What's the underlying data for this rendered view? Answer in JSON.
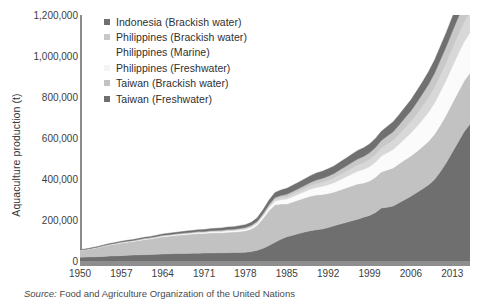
{
  "chart_data": {
    "type": "area",
    "title": "",
    "xlabel": "",
    "ylabel": "Aquaculture production (t)",
    "ylim": [
      0,
      1200000
    ],
    "xlim": [
      1950,
      2016
    ],
    "grid": false,
    "stacked": true,
    "legend_position": "top-left",
    "ytick_labels": [
      "1,200,000",
      "1,000,000",
      "800,000",
      "600,000",
      "400,000",
      "200,000",
      "0"
    ],
    "ytick_values": [
      1200000,
      1000000,
      800000,
      600000,
      400000,
      200000,
      0
    ],
    "xtick_labels": [
      "1950",
      "1957",
      "1964",
      "1971",
      "1978",
      "1985",
      "1992",
      "1999",
      "2006",
      "2013"
    ],
    "xtick_values": [
      1950,
      1957,
      1964,
      1971,
      1978,
      1985,
      1992,
      1999,
      2006,
      2013
    ],
    "x": [
      1950,
      1951,
      1952,
      1953,
      1954,
      1955,
      1956,
      1957,
      1958,
      1959,
      1960,
      1961,
      1962,
      1963,
      1964,
      1965,
      1966,
      1967,
      1968,
      1969,
      1970,
      1971,
      1972,
      1973,
      1974,
      1975,
      1976,
      1977,
      1978,
      1979,
      1980,
      1981,
      1982,
      1983,
      1984,
      1985,
      1986,
      1987,
      1988,
      1989,
      1990,
      1991,
      1992,
      1993,
      1994,
      1995,
      1996,
      1997,
      1998,
      1999,
      2000,
      2001,
      2002,
      2003,
      2004,
      2005,
      2006,
      2007,
      2008,
      2009,
      2010,
      2011,
      2012,
      2013,
      2014,
      2015,
      2016
    ],
    "series": [
      {
        "name": "Taiwan (Freshwater)",
        "color": "#6f6f6f",
        "stack_order": 1,
        "values": [
          18000,
          19000,
          20000,
          21000,
          22000,
          24000,
          25000,
          26000,
          28000,
          29000,
          30000,
          31000,
          32000,
          33000,
          34000,
          35000,
          36000,
          36500,
          37000,
          37500,
          38000,
          38500,
          39000,
          39500,
          40000,
          40500,
          41000,
          42000,
          43000,
          46000,
          52000,
          62000,
          76000,
          92000,
          106000,
          118000,
          126000,
          134000,
          141000,
          148000,
          152000,
          156000,
          163000,
          172000,
          180000,
          188000,
          196000,
          204000,
          214000,
          222000,
          236000,
          258000,
          262000,
          268000,
          284000,
          300000,
          316000,
          334000,
          352000,
          372000,
          398000,
          436000,
          480000,
          530000,
          580000,
          630000,
          668000
        ]
      },
      {
        "name": "Taiwan (Brackish water)",
        "color": "#c2c2c2",
        "stack_order": 2,
        "values": [
          34000,
          36000,
          40000,
          44000,
          50000,
          54000,
          58000,
          62000,
          64000,
          66000,
          70000,
          74000,
          76000,
          80000,
          84000,
          86000,
          88000,
          90000,
          92000,
          94000,
          96000,
          96000,
          98000,
          98000,
          98000,
          100000,
          100000,
          102000,
          104000,
          110000,
          122000,
          146000,
          170000,
          182000,
          172000,
          160000,
          162000,
          164000,
          166000,
          168000,
          170000,
          168000,
          166000,
          164000,
          166000,
          168000,
          170000,
          172000,
          166000,
          168000,
          172000,
          176000,
          182000,
          186000,
          190000,
          194000,
          196000,
          200000,
          206000,
          212000,
          220000,
          228000,
          234000,
          240000,
          244000,
          248000,
          250000
        ]
      },
      {
        "name": "Philippines (Freshwater)",
        "color": "#fbfbfb",
        "stack_order": 3,
        "values": [
          1000,
          1000,
          1200,
          1400,
          1600,
          1800,
          2000,
          2200,
          2400,
          2600,
          2800,
          3000,
          3200,
          3400,
          3600,
          3800,
          4000,
          4200,
          4400,
          4600,
          4800,
          5000,
          5400,
          5800,
          6200,
          6600,
          7000,
          7600,
          8200,
          9000,
          10000,
          12000,
          15000,
          18000,
          21000,
          24000,
          26000,
          28000,
          31000,
          34000,
          37000,
          40000,
          43000,
          46000,
          50000,
          54000,
          58000,
          62000,
          66000,
          70000,
          74000,
          78000,
          84000,
          90000,
          96000,
          104000,
          112000,
          122000,
          132000,
          142000,
          152000,
          162000,
          170000,
          178000,
          186000,
          192000,
          196000
        ]
      },
      {
        "name": "Philippines (Marine)",
        "color": "#d8d8d8",
        "stack_order": 4,
        "values": [
          500,
          500,
          600,
          700,
          800,
          900,
          1000,
          1100,
          1200,
          1300,
          1400,
          1500,
          1600,
          1700,
          1800,
          1900,
          2000,
          2100,
          2200,
          2300,
          2400,
          2500,
          2700,
          2900,
          3100,
          3300,
          3500,
          3800,
          4100,
          4500,
          5000,
          6000,
          7500,
          9000,
          10500,
          12000,
          13000,
          14000,
          15500,
          17000,
          18500,
          20000,
          21500,
          23000,
          25000,
          27000,
          29000,
          31000,
          33000,
          35000,
          37000,
          39000,
          42000,
          45000,
          48000,
          52000,
          56000,
          61000,
          66000,
          71000,
          76000,
          81000,
          85000,
          89000,
          93000,
          96000,
          98000
        ]
      },
      {
        "name": "Philippines (Brackish water)",
        "color": "#c8c8c8",
        "stack_order": 5,
        "values": [
          400,
          400,
          500,
          600,
          700,
          800,
          900,
          1000,
          1100,
          1200,
          1300,
          1400,
          1500,
          1600,
          1700,
          1800,
          1900,
          2000,
          2100,
          2200,
          2300,
          2400,
          2600,
          2800,
          3000,
          3200,
          3400,
          3700,
          4000,
          4400,
          4900,
          5800,
          7200,
          8600,
          10000,
          11400,
          12400,
          13400,
          14800,
          16200,
          17600,
          19000,
          20400,
          21800,
          23600,
          25400,
          27200,
          29000,
          31000,
          33000,
          35000,
          37000,
          39500,
          42000,
          45000,
          48500,
          52000,
          56500,
          61000,
          65500,
          70000,
          74500,
          78500,
          82000,
          85000,
          88000,
          90000
        ]
      },
      {
        "name": "Indonesia (Brackish water)",
        "color": "#707070",
        "stack_order": 6,
        "values": [
          2000,
          2200,
          2500,
          2800,
          3100,
          3400,
          3700,
          4000,
          4300,
          4600,
          5000,
          5400,
          5800,
          6200,
          6600,
          7000,
          7400,
          7800,
          8200,
          8600,
          9000,
          9400,
          10000,
          10600,
          11200,
          11800,
          12400,
          13200,
          14000,
          15000,
          16500,
          19000,
          22000,
          25000,
          27000,
          29000,
          30000,
          31000,
          32000,
          33000,
          34000,
          35000,
          36000,
          37000,
          38000,
          39000,
          40000,
          41000,
          42000,
          43000,
          44000,
          45000,
          46500,
          48000,
          50000,
          52000,
          54000,
          56500,
          59000,
          61500,
          64000,
          66500,
          68500,
          70500,
          72000,
          73500,
          75000
        ]
      }
    ],
    "legend_entries": [
      {
        "label": "Indonesia (Brackish water)",
        "color": "#707070"
      },
      {
        "label": "Philippines (Brackish water)",
        "color": "#c8c8c8"
      },
      {
        "label": "Philippines (Marine)",
        "color": "#ffffff"
      },
      {
        "label": "Philippines (Freshwater)",
        "color": "#f4f4f4"
      },
      {
        "label": "Taiwan (Brackish water)",
        "color": "#c2c2c2"
      },
      {
        "label": "Taiwan (Freshwater)",
        "color": "#6f6f6f"
      }
    ],
    "source_prefix": "Source:",
    "source_text": "Food and Agriculture Organization of the United Nations"
  }
}
